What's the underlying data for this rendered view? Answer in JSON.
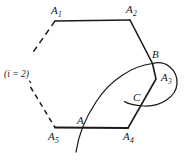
{
  "figure": {
    "name": "partial-hexagon-with-loop-curve",
    "background_color": "#ffffff",
    "stroke_color": "#1a1a1a",
    "width": 184,
    "height": 161
  },
  "labels": {
    "a1": {
      "base": "A",
      "sub": "1"
    },
    "a2": {
      "base": "A",
      "sub": "2"
    },
    "a3": {
      "base": "A",
      "sub": "3"
    },
    "a4": {
      "base": "A",
      "sub": "4"
    },
    "a5": {
      "base": "A",
      "sub": "5"
    },
    "b": "B",
    "c": "C",
    "a": "A",
    "index_note": "(i = 2)"
  },
  "geometry": {
    "vertices": {
      "A1": [
        55,
        21
      ],
      "A2": [
        130,
        20
      ],
      "B": [
        152,
        63
      ],
      "A3": [
        157,
        80
      ],
      "A4": [
        128,
        128
      ],
      "A5": [
        55,
        127
      ],
      "A": [
        80,
        127
      ],
      "C": [
        134,
        104
      ]
    },
    "solid_edges": [
      [
        "A1",
        "A2"
      ],
      [
        "A2",
        "B"
      ],
      [
        "B",
        "A4"
      ],
      [
        "A5",
        "A4"
      ]
    ],
    "dashed_edges": [
      [
        "A1",
        "down-left-stub"
      ],
      [
        "upper-left-stub",
        "A5"
      ]
    ],
    "curves": [
      {
        "name": "long-arc-A-to-B",
        "description": "arc rising from below bottom edge through A up to B"
      },
      {
        "name": "loop-B-to-C",
        "description": "loop from B bulging right and returning left to near C"
      }
    ]
  }
}
